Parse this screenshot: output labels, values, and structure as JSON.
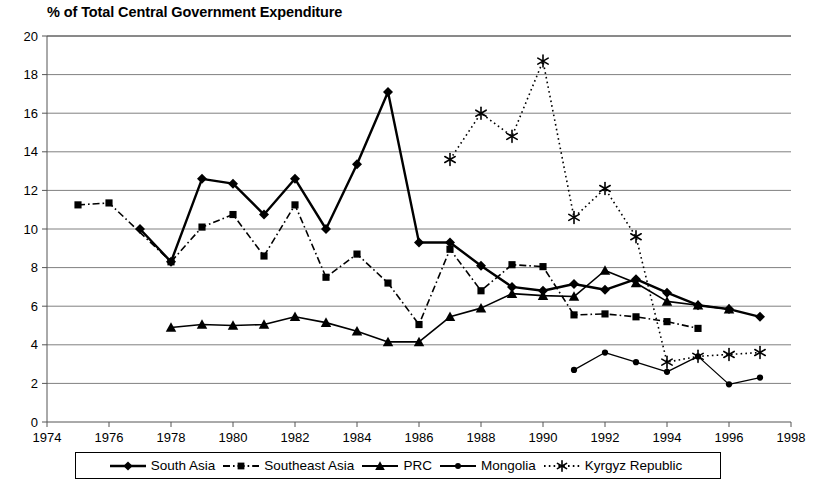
{
  "chart_data": {
    "type": "line",
    "title": "% of Total Central Government Expenditure",
    "xlabel": "",
    "ylabel": "",
    "xlim": [
      1974,
      1998
    ],
    "ylim": [
      0,
      20
    ],
    "xticks": [
      1974,
      1976,
      1978,
      1980,
      1982,
      1984,
      1986,
      1988,
      1990,
      1992,
      1994,
      1996,
      1998
    ],
    "yticks": [
      0,
      2,
      4,
      6,
      8,
      10,
      12,
      14,
      16,
      18,
      20
    ],
    "grid": "horizontal",
    "legend_position": "bottom",
    "series": [
      {
        "name": "South Asia",
        "marker": "diamond",
        "line_style": "solid",
        "color": "#000000",
        "x": [
          1977,
          1978,
          1979,
          1980,
          1981,
          1982,
          1983,
          1984,
          1985,
          1986,
          1987,
          1988,
          1989,
          1990,
          1991,
          1992,
          1993,
          1994,
          1995,
          1996,
          1997
        ],
        "values": [
          10.0,
          8.3,
          12.6,
          12.35,
          10.75,
          12.6,
          10.0,
          13.35,
          17.1,
          9.3,
          9.3,
          8.1,
          7.0,
          6.8,
          7.15,
          6.85,
          7.4,
          6.7,
          6.05,
          5.85,
          5.45
        ]
      },
      {
        "name": "Southeast Asia",
        "marker": "square",
        "line_style": "dash-dot",
        "color": "#000000",
        "x": [
          1975,
          1976,
          1978,
          1979,
          1980,
          1981,
          1982,
          1983,
          1984,
          1985,
          1986,
          1987,
          1988,
          1989,
          1990,
          1991,
          1992,
          1993,
          1994,
          1995
        ],
        "values": [
          11.25,
          11.35,
          8.3,
          10.1,
          10.75,
          8.6,
          11.25,
          7.5,
          8.7,
          7.2,
          5.05,
          8.95,
          6.8,
          8.15,
          8.05,
          5.55,
          5.6,
          5.45,
          5.2,
          4.85
        ]
      },
      {
        "name": "PRC",
        "marker": "triangle",
        "line_style": "solid",
        "color": "#000000",
        "x": [
          1978,
          1979,
          1980,
          1981,
          1982,
          1983,
          1984,
          1985,
          1986,
          1987,
          1988,
          1989,
          1990,
          1991,
          1992,
          1993,
          1994,
          1995,
          1996
        ],
        "values": [
          4.9,
          5.05,
          5.0,
          5.05,
          5.45,
          5.15,
          4.7,
          4.15,
          4.15,
          5.45,
          5.9,
          6.65,
          6.55,
          6.5,
          7.85,
          7.2,
          6.25,
          6.05,
          5.85
        ]
      },
      {
        "name": "Mongolia",
        "marker": "circle",
        "line_style": "solid",
        "color": "#000000",
        "x": [
          1991,
          1992,
          1993,
          1994,
          1995,
          1996,
          1997
        ],
        "values": [
          2.7,
          3.6,
          3.1,
          2.6,
          3.4,
          1.95,
          2.3
        ]
      },
      {
        "name": "Kyrgyz Republic",
        "marker": "asterisk",
        "line_style": "dotted",
        "color": "#000000",
        "x": [
          1987,
          1988,
          1989,
          1990,
          1991,
          1992,
          1993,
          1994,
          1995,
          1996,
          1997
        ],
        "values": [
          13.6,
          16.0,
          14.8,
          18.7,
          10.6,
          12.1,
          9.6,
          3.1,
          3.4,
          3.5,
          3.6
        ]
      }
    ]
  },
  "legend": {
    "items": [
      {
        "label": "South Asia"
      },
      {
        "label": "Southeast Asia"
      },
      {
        "label": "PRC"
      },
      {
        "label": "Mongolia"
      },
      {
        "label": "Kyrgyz Republic"
      }
    ]
  }
}
